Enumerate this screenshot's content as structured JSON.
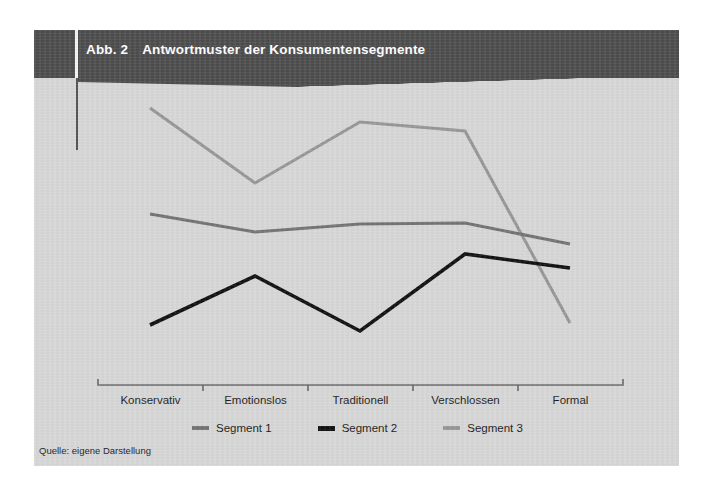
{
  "figure": {
    "title_number": "Abb. 2",
    "title_text": "Antwortmuster der Konsumentensegmente",
    "source_note": "Quelle: eigene Darstellung",
    "background_color": "#d7d7d7",
    "header_band_color": "#4d4d4d",
    "title_color": "#ffffff"
  },
  "chart_data": {
    "type": "line",
    "title": "Antwortmuster der Konsumentensegmente",
    "subtitle": "",
    "xlabel": "",
    "ylabel": "",
    "categories": [
      "Konservativ",
      "Emotionslos",
      "Traditionell",
      "Verschlossen",
      "Formal"
    ],
    "ylim": [
      1,
      7
    ],
    "yaxis_ticks_visible": false,
    "grid": false,
    "legend_position": "bottom-center",
    "series": [
      {
        "name": "Segment 1",
        "color": "#737373",
        "linewidth": 3,
        "values": [
          4.95,
          4.45,
          4.55,
          4.6,
          4.0
        ]
      },
      {
        "name": "Segment 2",
        "color": "#111111",
        "linewidth": 3.6,
        "values": [
          2.5,
          3.3,
          2.2,
          3.6,
          3.35
        ]
      },
      {
        "name": "Segment 3",
        "color": "#979797",
        "linewidth": 3,
        "values": [
          6.7,
          5.85,
          6.5,
          6.4,
          2.6
        ]
      }
    ],
    "annotations": []
  },
  "legend": {
    "items": [
      {
        "label": "Segment 1",
        "color": "#737373"
      },
      {
        "label": "Segment 2",
        "color": "#111111"
      },
      {
        "label": "Segment 3",
        "color": "#979797"
      }
    ]
  },
  "axis": {
    "line_color": "#6a6a6a",
    "tick_positions_px": [
      64,
      169,
      274,
      379,
      484,
      589
    ],
    "point_x_px": [
      116,
      221,
      326,
      431,
      536
    ],
    "axis_y_px": 355
  },
  "plot_points_px": {
    "segment1": [
      [
        116,
        184
      ],
      [
        221,
        202
      ],
      [
        326,
        194
      ],
      [
        431,
        193
      ],
      [
        536,
        214
      ]
    ],
    "segment2": [
      [
        116,
        295
      ],
      [
        221,
        246
      ],
      [
        326,
        301
      ],
      [
        431,
        224
      ],
      [
        536,
        238
      ]
    ],
    "segment3": [
      [
        116,
        78
      ],
      [
        221,
        153
      ],
      [
        326,
        92
      ],
      [
        431,
        101
      ],
      [
        536,
        293
      ]
    ]
  }
}
